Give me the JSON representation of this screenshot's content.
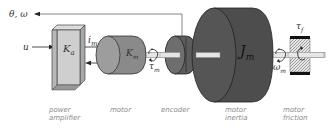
{
  "diagram": {
    "output_signal": "θ, ω",
    "input_signal": "u",
    "amplifier_gain": "K",
    "amplifier_gain_sub": "a",
    "motor_current": "i",
    "motor_current_sub": "m",
    "motor_constant": "K",
    "motor_constant_sub": "m",
    "motor_torque": "τ",
    "motor_torque_sub": "m",
    "inertia": "J",
    "inertia_sub": "m",
    "friction_torque": "τ",
    "friction_torque_sub": "f",
    "angular_velocity": "ω",
    "angular_velocity_sub": "m"
  },
  "captions": {
    "power_amplifier_line1": "power",
    "power_amplifier_line2": "amplifier",
    "motor": "motor",
    "encoder": "encoder",
    "motor_inertia_line1": "motor",
    "motor_inertia_line2": "inertia",
    "motor_friction_line1": "motor",
    "motor_friction_line2": "friction"
  },
  "colors": {
    "amplifier_face": "#c8c8c8",
    "motor_body": "#8c8c8c",
    "encoder_body": "#5a5a5a",
    "inertia_body": "#4a4a4a",
    "shaft": "#e6e6e6",
    "caption_text": "#8a8a8a"
  }
}
